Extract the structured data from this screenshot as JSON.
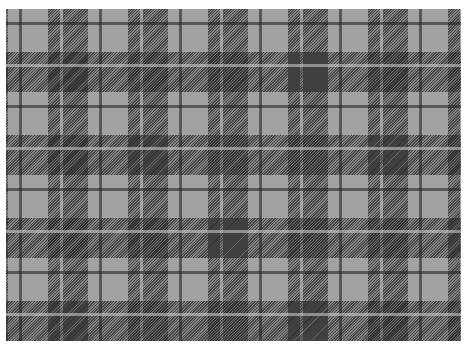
{
  "pattern": {
    "name": "grayscale tartan plaid",
    "colors": {
      "background": "#ffffff",
      "light": "#a2a2a2",
      "mid": "#6e6e6e",
      "dark": "#3a3a3a",
      "line_dark": "#3c3c3c",
      "line_light": "#b8b8b8"
    },
    "period_x": 80,
    "period_y": 83
  }
}
